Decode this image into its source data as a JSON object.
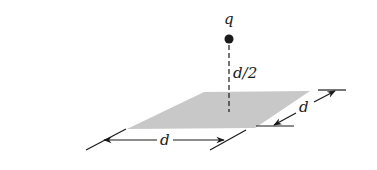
{
  "diagram": {
    "charge_label": "q",
    "height_label": "d/2",
    "width_label": "d",
    "depth_label": "d",
    "colors": {
      "ink": "#1a1a1a",
      "plate_fill": "#c8c8c8",
      "background": "#ffffff"
    }
  }
}
